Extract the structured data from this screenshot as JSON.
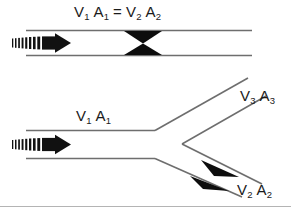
{
  "figure": {
    "background_color": "#ffffff",
    "pipe_line_color": "#6e6e6e",
    "arrow_color": "#111111",
    "text_color": "#1a1a1a",
    "border_color": "#b4b4b4"
  },
  "top_diagram": {
    "name": "constricted-pipe-venturi",
    "equation_label": {
      "full_text": "V1 A1 = V2 A2",
      "v_left": "V",
      "v_left_sub": "1",
      "a_left": "A",
      "a_left_sub": "1",
      "equals": "=",
      "v_right": "V",
      "v_right_sub": "2",
      "a_right": "A",
      "a_right_sub": "2"
    },
    "flow_arrow": {
      "name": "inlet-flow-arrow",
      "direction": "right",
      "style": "striped-tail-solid-head"
    },
    "constriction": {
      "name": "venturi-throat",
      "shape": "two opposed solid black triangles",
      "count": 2
    }
  },
  "bottom_diagram": {
    "name": "branching-pipe-y-junction",
    "inlet_label": {
      "full_text": "V1 A1",
      "v": "V",
      "v_sub": "1",
      "a": "A",
      "a_sub": "1"
    },
    "upper_branch_label": {
      "full_text": "V3 A3",
      "v": "V",
      "v_sub": "3",
      "a": "A",
      "a_sub": "3"
    },
    "lower_branch_label": {
      "full_text": "V2 A2",
      "v": "V",
      "v_sub": "2",
      "a": "A",
      "a_sub": "2"
    },
    "flow_arrow": {
      "name": "inlet-flow-arrow",
      "direction": "right",
      "style": "striped-tail-solid-head"
    },
    "branch_arrows": {
      "name": "lower-branch-flow-arrowheads",
      "count": 2,
      "style": "slender-dart",
      "direction": "down-right"
    }
  }
}
